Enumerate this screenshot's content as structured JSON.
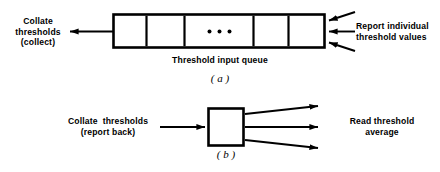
{
  "figure": {
    "background": "#ffffff",
    "ink": "#000000",
    "panels": [
      {
        "id": "a",
        "panel_label": "( a )",
        "diagram_label": "queue-with-cells",
        "left_label": "Collate\nthresholds\n(collect)",
        "left_label_lines": [
          "Collate",
          "thresholds",
          "(collect)"
        ],
        "right_label": "Report individual\nthreshold values",
        "right_label_lines": [
          "Report individual",
          "threshold values"
        ],
        "caption": "Threshold input queue",
        "queue": {
          "cells": 5,
          "ellipsis": "• • •",
          "ellipsis_cell_index": 2
        },
        "arrows": {
          "outgoing_left": 1,
          "incoming_right": 3
        }
      },
      {
        "id": "b",
        "panel_label": "( b )",
        "diagram_label": "single-box",
        "left_label": "Collate  thresholds\n(report back)",
        "left_label_lines": [
          "Collate  thresholds",
          "(report back)"
        ],
        "right_label": "Read threshold\naverage",
        "right_label_lines": [
          "Read threshold",
          "average"
        ],
        "arrows": {
          "incoming_left": 1,
          "outgoing_right": 3
        }
      }
    ]
  }
}
